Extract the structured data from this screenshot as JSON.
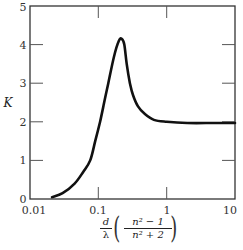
{
  "chart_data": {
    "type": "line",
    "title": "",
    "xlabel": "d/λ ((n² − 1)/(n² + 2))",
    "ylabel": "K",
    "xscale": "log",
    "xlim": [
      0.01,
      10
    ],
    "ylim": [
      0,
      5
    ],
    "x_ticks": [
      "0.01",
      "0.1",
      "1",
      "10"
    ],
    "y_ticks": [
      "0",
      "1",
      "2",
      "3",
      "4",
      "5"
    ],
    "grid": false,
    "legend": null,
    "series": [
      {
        "name": "K",
        "x": [
          0.021,
          0.03,
          0.045,
          0.06,
          0.076,
          0.09,
          0.106,
          0.125,
          0.14,
          0.17,
          0.2,
          0.22,
          0.24,
          0.26,
          0.29,
          0.32,
          0.38,
          0.48,
          0.65,
          1.0,
          2.0,
          5.0,
          10.0
        ],
        "y": [
          0.05,
          0.15,
          0.4,
          0.7,
          1.0,
          1.5,
          2.0,
          2.6,
          3.0,
          3.7,
          4.1,
          4.15,
          4.0,
          3.5,
          3.0,
          2.7,
          2.4,
          2.2,
          2.05,
          2.0,
          1.97,
          1.97,
          1.97
        ]
      }
    ]
  },
  "labels": {
    "y_axis": "K",
    "x_tick_0": "0.01",
    "x_tick_1": "0.1",
    "x_tick_2": "1",
    "x_tick_3": "10",
    "y_tick_0": "0",
    "y_tick_1": "1",
    "y_tick_2": "2",
    "y_tick_3": "3",
    "y_tick_4": "4",
    "y_tick_5": "5",
    "x_frac1_num": "d",
    "x_frac1_den": "λ",
    "x_frac2_num": "n² − 1",
    "x_frac2_den": "n² + 2",
    "paren_open": "(",
    "paren_close": ")"
  }
}
